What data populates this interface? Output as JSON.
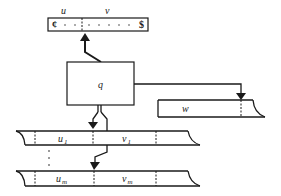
{
  "diagram": {
    "input_tape": {
      "label_u": "u",
      "label_v": "v",
      "left_marker": "¢",
      "right_marker": "$"
    },
    "control": {
      "state_label": "q"
    },
    "output_tape": {
      "label": "w"
    },
    "work_tapes": [
      {
        "left_label": "u",
        "left_sub": "1",
        "right_label": "v",
        "right_sub": "1"
      },
      {
        "left_label": "u",
        "left_sub": "m",
        "right_label": "v",
        "right_sub": "m"
      }
    ],
    "ellipsis": "⋮"
  }
}
